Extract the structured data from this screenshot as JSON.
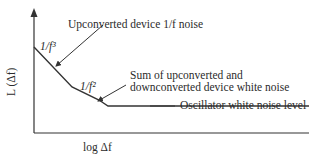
{
  "diagram": {
    "type": "phase-noise-spectrum",
    "y_axis_label": "L (Δf)",
    "x_axis_label": "log Δf",
    "regions": [
      {
        "label": "1/f³",
        "slope": "1/f^3"
      },
      {
        "label": "1/f²",
        "slope": "1/f^2"
      }
    ],
    "annotations": {
      "upconverted": "Upconverted device 1/f noise",
      "sum_line1": "Sum of upconverted and",
      "sum_line2": "downconverted device white noise",
      "white_floor": "Oscillator white noise level"
    },
    "colors": {
      "line": "#333333",
      "text": "#2b2b2b"
    }
  }
}
